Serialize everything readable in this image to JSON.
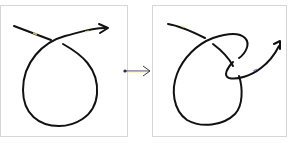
{
  "diagram": {
    "type": "knot-transformation",
    "panels": [
      {
        "id": "before",
        "description": "Curve with a single loop and one crossing, ending in an arrowhead"
      },
      {
        "id": "after",
        "description": "Curve with the loop deformed: the strand passes under and forms an extra twist, ending in an arrowhead"
      }
    ],
    "transition": {
      "symbol": "arrow-right",
      "from": "before",
      "to": "after"
    },
    "colors": {
      "stroke": "#111111",
      "border": "#d6d6d6",
      "highlight": "#f2e87a",
      "arrow": "#3a3a5a"
    }
  }
}
